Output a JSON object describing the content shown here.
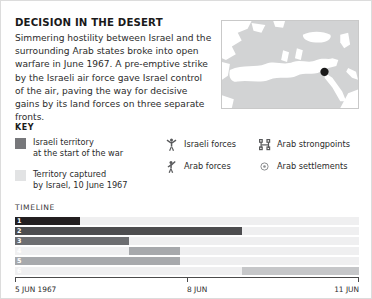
{
  "header": {
    "title": "DECISION IN THE DESERT",
    "body": "Simmering hostility between Israel and the surrounding Arab states broke into open warfare in June 1967. A pre-emptive strike by the Israeli air force gave Israel control of the air, paving the way for decisive gains by its land forces on three separate fronts."
  },
  "map": {
    "name": "mediterranean-middle-east-locator-map",
    "land_color": "#d2d3d4",
    "sea_color": "#ffffff",
    "marker_label": "Israel",
    "marker_color": "#1a1a1a"
  },
  "key": {
    "title": "KEY",
    "swatches": [
      {
        "label": "Israeli territory\nat the start of the war",
        "color": "#77787b",
        "icon": "territory-swatch-dark"
      },
      {
        "label": "Territory captured\nby Israel, 10 June 1967",
        "color": "#e2e3e4",
        "icon": "territory-swatch-light"
      }
    ],
    "symbols": [
      {
        "label": "Israeli forces",
        "icon": "israeli-forces-figure-icon"
      },
      {
        "label": "Arab forces",
        "icon": "arab-forces-figure-icon"
      },
      {
        "label": "Arab strongpoints",
        "icon": "arab-strongpoint-fort-icon"
      },
      {
        "label": "Arab settlements",
        "icon": "arab-settlement-circle-icon"
      }
    ]
  },
  "timeline": {
    "title": "TIMELINE",
    "track_color": "#efeff0",
    "axis_labels": [
      {
        "text": "5 JUN 1967",
        "pos_pct": 0
      },
      {
        "text": "8 JUN",
        "pos_pct": 50
      },
      {
        "text": "11 JUN",
        "pos_pct": 100
      }
    ],
    "ticks_pct": [
      0,
      50,
      100
    ],
    "rows": [
      {
        "num": "1",
        "start_pct": 0,
        "end_pct": 19,
        "color": "#231f20"
      },
      {
        "num": "2",
        "start_pct": 0,
        "end_pct": 66,
        "color": "#4d4d4f"
      },
      {
        "num": "3",
        "start_pct": 0,
        "end_pct": 33,
        "color": "#6d6e71"
      },
      {
        "num": "4",
        "start_pct": 33,
        "end_pct": 48,
        "color": "#a7a9ac"
      },
      {
        "num": "5",
        "start_pct": 0,
        "end_pct": 48,
        "color": "#a7a9ac"
      },
      {
        "num": "6",
        "start_pct": 66,
        "end_pct": 100,
        "color": "#c6c7c9"
      }
    ]
  }
}
